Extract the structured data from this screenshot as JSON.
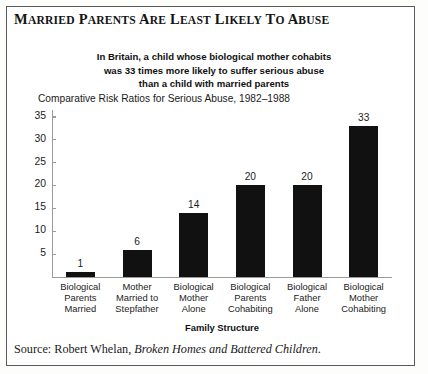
{
  "figure": {
    "title": "MARRIED PARENTS ARE LEAST LIKELY TO ABUSE",
    "subtitle_lines": [
      "In Britain, a child whose biological mother cohabits",
      "was 33 times more likely to suffer serious abuse",
      "than a child with married parents"
    ],
    "source_prefix": "Source: Robert Whelan, ",
    "source_book": "Broken Homes and Battered Children",
    "source_suffix": "."
  },
  "chart_data": {
    "type": "bar",
    "title": "Comparative Risk Ratios for Serious Abuse, 1982–1988",
    "xlabel": "Family Structure",
    "ylabel": "",
    "categories": [
      "Biological\nParents\nMarried",
      "Mother\nMarried to\nStepfather",
      "Biological\nMother\nAlone",
      "Biological\nParents\nCohabiting",
      "Biological\nFather\nAlone",
      "Biological\nMother\nCohabiting"
    ],
    "category_lines": [
      [
        "Biological",
        "Parents",
        "Married"
      ],
      [
        "Mother",
        "Married to",
        "Stepfather"
      ],
      [
        "Biological",
        "Mother",
        "Alone"
      ],
      [
        "Biological",
        "Parents",
        "Cohabiting"
      ],
      [
        "Biological",
        "Father",
        "Alone"
      ],
      [
        "Biological",
        "Mother",
        "Cohabiting"
      ]
    ],
    "values": [
      1,
      6,
      14,
      20,
      20,
      33
    ],
    "value_labels": [
      "1",
      "6",
      "14",
      "20",
      "20",
      "33"
    ],
    "ylim": [
      0,
      36.5
    ],
    "yticks": [
      5,
      10,
      15,
      20,
      25,
      30,
      35
    ],
    "ytick_labels": [
      "5",
      "10",
      "15",
      "20",
      "25",
      "30",
      "35"
    ],
    "grid": false,
    "legend": null,
    "bar_color": "#111111",
    "axis_color": "#9a9a98"
  }
}
